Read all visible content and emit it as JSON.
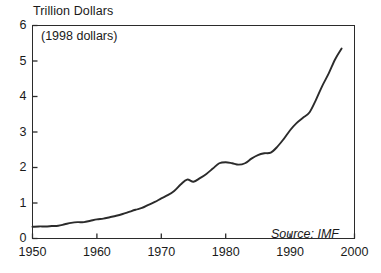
{
  "chart_data": {
    "type": "line",
    "title": "Trillion Dollars",
    "subtitle": "(1998 dollars)",
    "source_note": "Source: IMF",
    "xlabel": "",
    "ylabel": "",
    "xlim": [
      1950,
      2000
    ],
    "ylim": [
      0,
      6
    ],
    "xticks": [
      "1950",
      "1960",
      "1970",
      "1980",
      "1990",
      "2000"
    ],
    "yticks": [
      "0",
      "1",
      "2",
      "3",
      "4",
      "5",
      "6"
    ],
    "grid": false,
    "legend": "none",
    "line_color": "#2b2b2b",
    "series": [
      {
        "name": "Value",
        "x": [
          1950,
          1951,
          1952,
          1953,
          1954,
          1955,
          1956,
          1957,
          1958,
          1959,
          1960,
          1961,
          1962,
          1963,
          1964,
          1965,
          1966,
          1967,
          1968,
          1969,
          1970,
          1971,
          1972,
          1973,
          1974,
          1975,
          1976,
          1977,
          1978,
          1979,
          1980,
          1981,
          1982,
          1983,
          1984,
          1985,
          1986,
          1987,
          1988,
          1989,
          1990,
          1991,
          1992,
          1993,
          1994,
          1995,
          1996,
          1997,
          1998
        ],
        "values": [
          0.33,
          0.34,
          0.34,
          0.35,
          0.36,
          0.4,
          0.44,
          0.46,
          0.46,
          0.5,
          0.54,
          0.56,
          0.6,
          0.64,
          0.69,
          0.75,
          0.81,
          0.86,
          0.95,
          1.03,
          1.13,
          1.22,
          1.34,
          1.52,
          1.66,
          1.6,
          1.7,
          1.82,
          1.97,
          2.12,
          2.15,
          2.12,
          2.08,
          2.12,
          2.25,
          2.35,
          2.4,
          2.42,
          2.58,
          2.8,
          3.05,
          3.25,
          3.4,
          3.55,
          3.9,
          4.3,
          4.65,
          5.05,
          5.35
        ]
      }
    ]
  },
  "axis": {
    "y_tick_labels": [
      "6",
      "5",
      "4",
      "3",
      "2",
      "1",
      "0"
    ],
    "x_tick_labels": [
      "1950",
      "1960",
      "1970",
      "1980",
      "1990",
      "2000"
    ]
  }
}
